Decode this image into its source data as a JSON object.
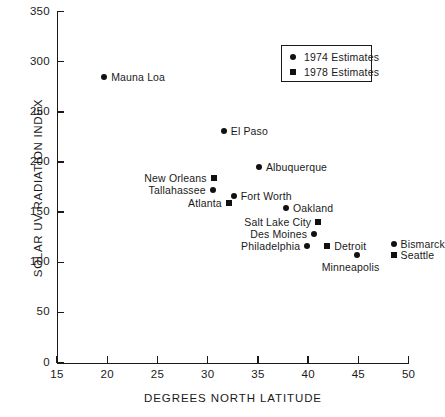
{
  "chart_data": {
    "type": "scatter",
    "title": "",
    "xlabel": "DEGREES NORTH LATITUDE",
    "ylabel": "SOLAR UV RADIATION INDEX",
    "xlim": [
      15,
      50
    ],
    "ylim": [
      0,
      350
    ],
    "xticks": [
      15,
      20,
      25,
      30,
      35,
      40,
      45,
      50
    ],
    "yticks": [
      0,
      50,
      100,
      150,
      200,
      250,
      300,
      350
    ],
    "grid": false,
    "legend_position": "upper right",
    "series": [
      {
        "name": "1974 Estimates",
        "marker": "circle",
        "color": "#111111"
      },
      {
        "name": "1978 Estimates",
        "marker": "square",
        "color": "#111111"
      }
    ],
    "points": [
      {
        "label": "Mauna Loa",
        "x": 19.7,
        "y": 285,
        "marker": "circle",
        "label_side": "right"
      },
      {
        "label": "El Paso",
        "x": 31.6,
        "y": 231,
        "marker": "circle",
        "label_side": "right"
      },
      {
        "label": "Albuquerque",
        "x": 35.1,
        "y": 195,
        "marker": "circle",
        "label_side": "right"
      },
      {
        "label": "New Orleans",
        "x": 30.6,
        "y": 184,
        "marker": "square",
        "label_side": "left"
      },
      {
        "label": "Tallahassee",
        "x": 30.5,
        "y": 172,
        "marker": "circle",
        "label_side": "left"
      },
      {
        "label": "Fort Worth",
        "x": 32.6,
        "y": 166,
        "marker": "circle",
        "label_side": "right"
      },
      {
        "label": "Atlanta",
        "x": 32.1,
        "y": 159,
        "marker": "square",
        "label_side": "left"
      },
      {
        "label": "Oakland",
        "x": 37.8,
        "y": 154,
        "marker": "circle",
        "label_side": "right"
      },
      {
        "label": "Salt Lake City",
        "x": 41.0,
        "y": 140,
        "marker": "square",
        "label_side": "left"
      },
      {
        "label": "Des Moines",
        "x": 40.6,
        "y": 128,
        "marker": "circle",
        "label_side": "left"
      },
      {
        "label": "Detroit",
        "x": 41.9,
        "y": 116,
        "marker": "square",
        "label_side": "right"
      },
      {
        "label": "Philadelphia",
        "x": 39.9,
        "y": 116,
        "marker": "circle",
        "label_side": "left"
      },
      {
        "label": "Minneapolis",
        "x": 44.9,
        "y": 107,
        "marker": "circle",
        "label_side": "below"
      },
      {
        "label": "Bismarck",
        "x": 48.5,
        "y": 118,
        "marker": "circle",
        "label_side": "right"
      },
      {
        "label": "Seattle",
        "x": 48.5,
        "y": 107,
        "marker": "square",
        "label_side": "right"
      }
    ]
  },
  "legend": {
    "items": [
      {
        "label": "1974 Estimates"
      },
      {
        "label": "1978 Estimates"
      }
    ]
  },
  "axes": {
    "x_title": "DEGREES NORTH LATITUDE",
    "y_title": "SOLAR UV RADIATION INDEX"
  }
}
